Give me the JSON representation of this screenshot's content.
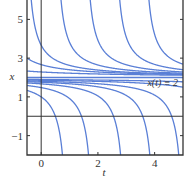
{
  "chart_data": {
    "type": "line",
    "title": "",
    "xlabel": "t",
    "ylabel": "x",
    "xlim": [
      -0.5,
      5.0
    ],
    "ylim": [
      -2,
      6
    ],
    "xticks": [
      0,
      2,
      4
    ],
    "xtick_labels": [
      "0",
      "2",
      "4"
    ],
    "yticks": [
      -1,
      1,
      3,
      5
    ],
    "ytick_labels": [
      "−1",
      "1",
      "3",
      "5"
    ],
    "grid": false,
    "legend": null,
    "annotation": {
      "text": "x(t) ≡ 2",
      "x": 4.2,
      "y": 1.6
    },
    "reference_lines": {
      "horizontal_zero": 0,
      "vertical_zero": 0
    },
    "series": [
      {
        "name": "equilibrium",
        "formula": "x = 2",
        "c": null
      },
      {
        "name": "upper c=-3.5",
        "branch": "upper",
        "c": -3.5
      },
      {
        "name": "upper c=-1.5",
        "branch": "upper",
        "c": -1.5
      },
      {
        "name": "upper c=-0.5",
        "branch": "upper",
        "c": -0.6
      },
      {
        "name": "upper c=0.5",
        "branch": "upper",
        "c": 0.45
      },
      {
        "name": "upper c=1.5",
        "branch": "upper",
        "c": 1.48
      },
      {
        "name": "upper c=2.5",
        "branch": "upper",
        "c": 2.52
      },
      {
        "name": "upper c=3.5",
        "branch": "upper",
        "c": 3.55
      },
      {
        "name": "lower c=1",
        "branch": "lower",
        "c": 1.0
      },
      {
        "name": "lower c=2",
        "branch": "lower",
        "c": 1.92
      },
      {
        "name": "lower c=3",
        "branch": "lower",
        "c": 3.05
      },
      {
        "name": "lower c=4",
        "branch": "lower",
        "c": 4.08
      },
      {
        "name": "lower c=5",
        "branch": "lower",
        "c": 5.1
      },
      {
        "name": "lower c=7",
        "branch": "lower",
        "c": 7.0
      },
      {
        "name": "lower c=9",
        "branch": "lower",
        "c": 9.5
      }
    ],
    "colors": {
      "curve": "#5a7fd6",
      "axis": "#333333",
      "frame": "#333333"
    }
  }
}
